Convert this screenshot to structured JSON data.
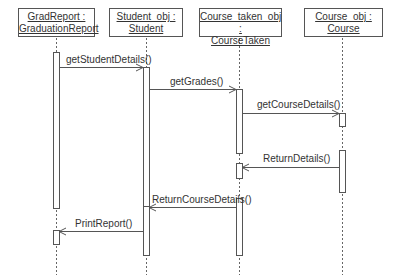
{
  "diagram": {
    "type": "sequence",
    "objects": [
      {
        "id": "grad",
        "name": "GradReport :",
        "class": "GraduationReport"
      },
      {
        "id": "student",
        "name": "Student_obj :",
        "class": "Student"
      },
      {
        "id": "coursetaken",
        "name": "Course_taken_obj :",
        "class": "CourseTaken"
      },
      {
        "id": "course",
        "name": "Course_obj :",
        "class": "Course"
      }
    ],
    "messages": [
      {
        "label": "getStudentDetails()",
        "from": "grad",
        "to": "student"
      },
      {
        "label": "getGrades()",
        "from": "student",
        "to": "coursetaken"
      },
      {
        "label": "getCourseDetails()",
        "from": "coursetaken",
        "to": "course"
      },
      {
        "label": "ReturnDetails()",
        "from": "course",
        "to": "coursetaken"
      },
      {
        "label": "ReturnCourseDetails()",
        "from": "coursetaken",
        "to": "student"
      },
      {
        "label": "PrintReport()",
        "from": "student",
        "to": "grad"
      }
    ],
    "colors": {
      "line": "#555555",
      "text": "#333333",
      "background": "#ffffff"
    }
  }
}
